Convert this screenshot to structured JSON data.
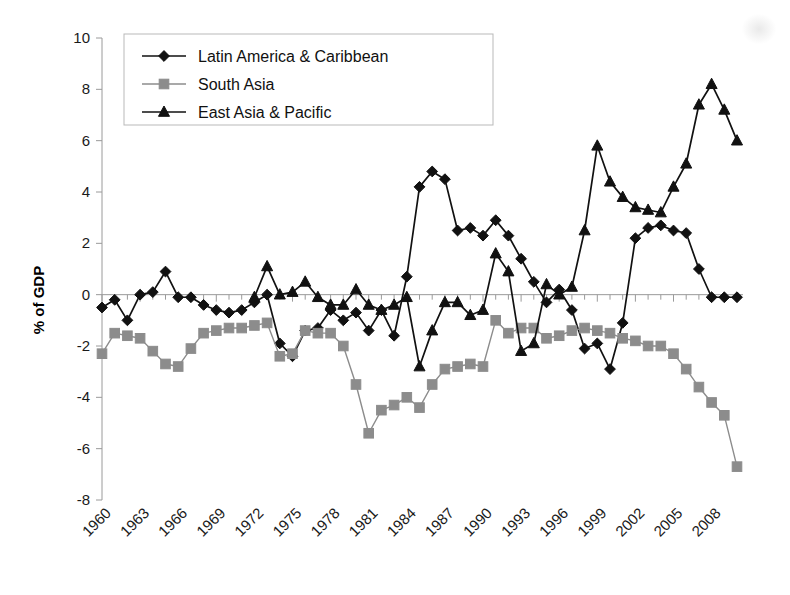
{
  "chart_data": {
    "type": "line",
    "title": "",
    "xlabel": "",
    "ylabel": "% of GDP",
    "ylim": [
      -8,
      10
    ],
    "ytick_step": 2,
    "yticks": [
      10,
      8,
      6,
      4,
      2,
      0,
      -2,
      -4,
      -6,
      -8
    ],
    "xlim": [
      1960,
      2010
    ],
    "xticks": [
      1960,
      1963,
      1966,
      1969,
      1972,
      1975,
      1978,
      1981,
      1984,
      1987,
      1990,
      1993,
      1996,
      1999,
      2002,
      2005,
      2008
    ],
    "xtick_rotation": 45,
    "grid": false,
    "legend_position": "top-left",
    "zero_line": true,
    "x": [
      1960,
      1961,
      1962,
      1963,
      1964,
      1965,
      1966,
      1967,
      1968,
      1969,
      1970,
      1971,
      1972,
      1973,
      1974,
      1975,
      1976,
      1977,
      1978,
      1979,
      1980,
      1981,
      1982,
      1983,
      1984,
      1985,
      1986,
      1987,
      1988,
      1989,
      1990,
      1991,
      1992,
      1993,
      1994,
      1995,
      1996,
      1997,
      1998,
      1999,
      2000,
      2001,
      2002,
      2003,
      2004,
      2005,
      2006,
      2007,
      2008,
      2009,
      2010
    ],
    "series": [
      {
        "name": "Latin America & Caribbean",
        "marker": "diamond",
        "color": "#111111",
        "values": [
          -0.5,
          -0.2,
          -1.0,
          0.0,
          0.1,
          0.9,
          -0.1,
          -0.1,
          -0.4,
          -0.6,
          -0.7,
          -0.6,
          -0.3,
          0.0,
          -1.9,
          -2.4,
          -1.4,
          -1.3,
          -0.6,
          -1.0,
          -0.7,
          -1.4,
          -0.6,
          -1.6,
          0.7,
          4.2,
          4.8,
          4.5,
          2.5,
          2.6,
          2.3,
          2.9,
          2.3,
          1.4,
          0.5,
          -0.3,
          0.2,
          -0.6,
          -2.1,
          -1.9,
          -2.9,
          -1.1,
          2.2,
          2.6,
          2.7,
          2.5,
          2.4,
          1.0,
          -0.1,
          -0.1,
          -0.1
        ]
      },
      {
        "name": "South Asia",
        "marker": "square",
        "color": "#8c8c8c",
        "values": [
          -2.3,
          -1.5,
          -1.6,
          -1.7,
          -2.2,
          -2.7,
          -2.8,
          -2.1,
          -1.5,
          -1.4,
          -1.3,
          -1.3,
          -1.2,
          -1.1,
          -2.4,
          -2.3,
          -1.4,
          -1.5,
          -1.5,
          -2.0,
          -3.5,
          -5.4,
          -4.5,
          -4.3,
          -4.0,
          -4.4,
          -3.5,
          -2.9,
          -2.8,
          -2.7,
          -2.8,
          -1.0,
          -1.5,
          -1.3,
          -1.3,
          -1.7,
          -1.6,
          -1.4,
          -1.3,
          -1.4,
          -1.5,
          -1.7,
          -1.8,
          -2.0,
          -2.0,
          -2.3,
          -2.9,
          -3.6,
          -4.2,
          -4.7,
          -6.7
        ]
      },
      {
        "name": "East Asia & Pacific",
        "marker": "triangle",
        "color": "#111111",
        "values": [
          null,
          null,
          null,
          null,
          null,
          null,
          null,
          null,
          null,
          null,
          null,
          null,
          -0.1,
          1.1,
          0.0,
          0.1,
          0.5,
          -0.1,
          -0.4,
          -0.4,
          0.2,
          -0.4,
          -0.6,
          -0.4,
          -0.1,
          -2.8,
          -1.4,
          -0.3,
          -0.3,
          -0.8,
          -0.6,
          1.6,
          0.9,
          -2.2,
          -1.9,
          0.4,
          0.0,
          0.3,
          2.5,
          5.8,
          4.4,
          3.8,
          3.4,
          3.3,
          3.2,
          4.2,
          5.1,
          7.4,
          8.2,
          7.2,
          6.0
        ]
      }
    ]
  },
  "legend": {
    "items": [
      {
        "label": "Latin America & Caribbean",
        "marker": "diamond",
        "color": "#111111"
      },
      {
        "label": "South Asia",
        "marker": "square",
        "color": "#8c8c8c"
      },
      {
        "label": "East Asia & Pacific",
        "marker": "triangle",
        "color": "#111111"
      }
    ]
  },
  "axes": {
    "y_title": "% of GDP"
  }
}
